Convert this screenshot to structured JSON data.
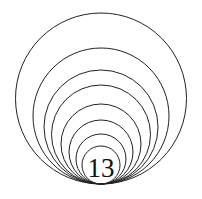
{
  "figure": {
    "label": "13",
    "stroke_color": "#222222",
    "background": "#ffffff",
    "tangent_point": {
      "x": 101,
      "y": 184
    },
    "circles": [
      {
        "r": 85.5
      },
      {
        "r": 68
      },
      {
        "r": 57
      },
      {
        "r": 49.5
      },
      {
        "r": 40
      },
      {
        "r": 32
      },
      {
        "r": 25
      },
      {
        "r": 19
      }
    ]
  }
}
